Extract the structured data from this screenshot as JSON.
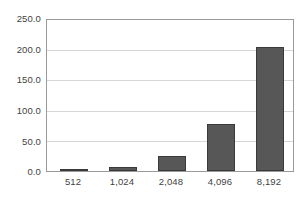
{
  "chart_data": {
    "type": "bar",
    "title": "",
    "subtitle": "",
    "xlabel": "",
    "ylabel": "",
    "categories": [
      "512",
      "1,024",
      "2,048",
      "4,096",
      "8,192"
    ],
    "values": [
      2,
      6,
      25,
      78,
      206
    ],
    "series": [
      {
        "name": "",
        "values": [
          2,
          6,
          25,
          78,
          206
        ]
      }
    ],
    "ylim": [
      0,
      250
    ],
    "ytick_values": [
      0,
      50,
      100,
      150,
      200,
      250
    ],
    "ytick_labels": [
      "0.0",
      "50.0",
      "100.0",
      "150.0",
      "200.0",
      "250.0"
    ],
    "grid": "horizontal",
    "legend": "none",
    "bar_color": "#575757",
    "bar_border_color": "#3a3a3a",
    "gridline_color": "#d6d6d6",
    "axis_border_color": "#9a9a9a",
    "label_color": "#3f3f3f",
    "background_color": "#ffffff"
  }
}
